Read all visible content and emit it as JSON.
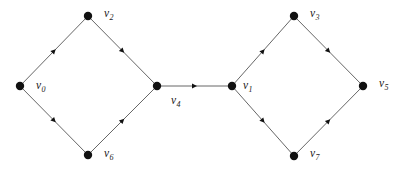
{
  "figure": {
    "kind": "directed-graph-diagram",
    "background_color": "#ffffff",
    "edge_color": "#555555",
    "node_color": "#111111",
    "label_color": "#1a1a1a",
    "node_radius": 4.2,
    "width": 406,
    "height": 169
  },
  "nodes": [
    {
      "id": "v0",
      "label": "v",
      "subscript": "0",
      "x": 20,
      "y": 86,
      "label_x": 36,
      "label_y": 80
    },
    {
      "id": "v2",
      "label": "v",
      "subscript": "2",
      "x": 88,
      "y": 16,
      "label_x": 104,
      "label_y": 8
    },
    {
      "id": "v6",
      "label": "v",
      "subscript": "6",
      "x": 88,
      "y": 155,
      "label_x": 104,
      "label_y": 148
    },
    {
      "id": "v4",
      "label": "v",
      "subscript": "4",
      "x": 157,
      "y": 86,
      "label_x": 171,
      "label_y": 95
    },
    {
      "id": "v1",
      "label": "v",
      "subscript": "1",
      "x": 232,
      "y": 86,
      "label_x": 243,
      "label_y": 80
    },
    {
      "id": "v3",
      "label": "v",
      "subscript": "3",
      "x": 294,
      "y": 16,
      "label_x": 310,
      "label_y": 8
    },
    {
      "id": "v7",
      "label": "v",
      "subscript": "7",
      "x": 294,
      "y": 156,
      "label_x": 310,
      "label_y": 148
    },
    {
      "id": "v5",
      "label": "v",
      "subscript": "5",
      "x": 363,
      "y": 86,
      "label_x": 379,
      "label_y": 78
    }
  ],
  "edges": [
    {
      "id": "e-v0-v2",
      "from": "v0",
      "to": "v2",
      "directed": true,
      "arrow_position": 0.5
    },
    {
      "id": "e-v2-v4",
      "from": "v2",
      "to": "v4",
      "directed": true,
      "arrow_position": 0.5
    },
    {
      "id": "e-v0-v6",
      "from": "v0",
      "to": "v6",
      "directed": true,
      "arrow_position": 0.5
    },
    {
      "id": "e-v6-v4",
      "from": "v6",
      "to": "v4",
      "directed": true,
      "arrow_position": 0.5
    },
    {
      "id": "e-v4-v1",
      "from": "v4",
      "to": "v1",
      "directed": true,
      "arrow_position": 0.5
    },
    {
      "id": "e-v1-v3",
      "from": "v1",
      "to": "v3",
      "directed": true,
      "arrow_position": 0.5
    },
    {
      "id": "e-v3-v5",
      "from": "v3",
      "to": "v5",
      "directed": true,
      "arrow_position": 0.5
    },
    {
      "id": "e-v1-v7",
      "from": "v1",
      "to": "v7",
      "directed": true,
      "arrow_position": 0.5
    },
    {
      "id": "e-v7-v5",
      "from": "v7",
      "to": "v5",
      "directed": true,
      "arrow_position": 0.5
    }
  ]
}
